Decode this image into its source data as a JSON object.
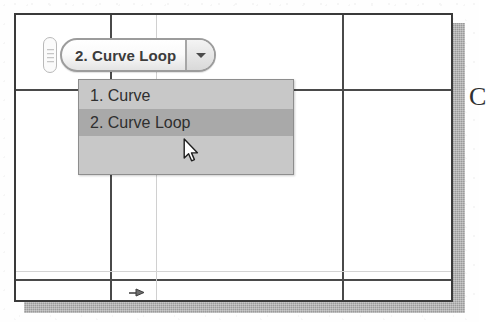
{
  "scene": {
    "description": "CAD drawing window with an open command combo-box dropdown",
    "colors": {
      "paper": "#fefefe",
      "window_border": "#3a3a3a",
      "construction_line": "#4a4a4a",
      "faint_line": "#d0d0d0",
      "shadow": "#9a9a9a",
      "dropdown_bg": "#c8c8c8",
      "dropdown_highlight": "#a9a9a9",
      "text": "#2f2f2f"
    }
  },
  "combo": {
    "grip_name": "drag-grip-handle",
    "value": "2. Curve Loop",
    "caret_icon": "chevron-down-icon"
  },
  "dropdown": {
    "items": [
      {
        "label": "1. Curve",
        "selected": false
      },
      {
        "label": "2. Curve Loop",
        "selected": true
      }
    ]
  },
  "cursor": {
    "icon": "mouse-pointer-arrow-icon"
  },
  "canvas": {
    "dim_marker_icon": "dimension-arrow-icon",
    "edge_glyph": "C"
  }
}
